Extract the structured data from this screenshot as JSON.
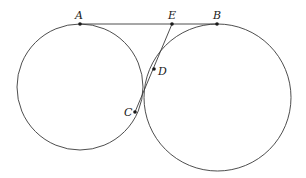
{
  "diagram": {
    "type": "geometry",
    "circles": [
      {
        "name": "left-circle",
        "cx": 80,
        "cy": 87,
        "r": 63
      },
      {
        "name": "right-circle",
        "cx": 217.5,
        "cy": 97.5,
        "r": 73.5
      }
    ],
    "points": [
      {
        "id": "A",
        "label": "A",
        "x": 80,
        "y": 24,
        "lx": 75,
        "ly": 19
      },
      {
        "id": "E",
        "label": "E",
        "x": 172,
        "y": 24,
        "lx": 168,
        "ly": 19
      },
      {
        "id": "B",
        "label": "B",
        "x": 217,
        "y": 24,
        "lx": 213,
        "ly": 19
      },
      {
        "id": "D",
        "label": "D",
        "x": 154,
        "y": 69,
        "lx": 158,
        "ly": 75
      },
      {
        "id": "C",
        "label": "C",
        "x": 135,
        "y": 112,
        "lx": 124,
        "ly": 116
      }
    ],
    "segments": [
      {
        "from": "A",
        "to": "B"
      },
      {
        "from": "E",
        "to": "C"
      }
    ],
    "stroke_color": "#3a3a3a"
  }
}
